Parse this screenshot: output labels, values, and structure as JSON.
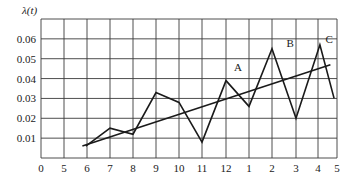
{
  "chart_data": {
    "type": "line",
    "title": "",
    "ylabel": "λ(t)",
    "xlabel": "",
    "x_tick_labels": [
      "0",
      "5",
      "6",
      "7",
      "8",
      "9",
      "10",
      "11",
      "12",
      "1",
      "2",
      "3",
      "4",
      "5"
    ],
    "y_tick_labels": [
      "0.01",
      "0.02",
      "0.03",
      "0.04",
      "0.05",
      "0.06"
    ],
    "y_ticks": [
      0.01,
      0.02,
      0.03,
      0.04,
      0.05,
      0.06
    ],
    "ylim": [
      0,
      0.07
    ],
    "grid": true,
    "legend": null,
    "series": [
      {
        "name": "observed",
        "x_index": [
          1.95,
          3,
          4,
          5,
          6,
          7,
          8,
          9,
          10,
          11,
          12.1,
          12.85
        ],
        "x_labels_at": [
          "~6",
          "7",
          "8",
          "9",
          "10",
          "11",
          "12",
          "1",
          "2",
          "3",
          "~4",
          "5"
        ],
        "values": [
          0.006,
          0.015,
          0.012,
          0.033,
          0.028,
          0.008,
          0.039,
          0.026,
          0.055,
          0.02,
          0.057,
          0.03
        ]
      },
      {
        "name": "trend",
        "x_index": [
          1.8,
          12.65
        ],
        "values": [
          0.006,
          0.047
        ]
      }
    ],
    "annotations": [
      {
        "text": "A",
        "x_index": 8.35,
        "value": 0.043
      },
      {
        "text": "B",
        "x_index": 10.6,
        "value": 0.055
      },
      {
        "text": "C",
        "x_index": 12.4,
        "value": 0.057
      }
    ]
  }
}
